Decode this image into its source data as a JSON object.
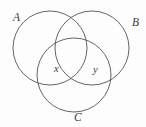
{
  "figure": {
    "type": "venn-diagram-three-sets",
    "background_color": "#fdfdfd",
    "stroke_color": "#555555"
  },
  "sets": [
    {
      "id": "A",
      "label": "A",
      "cx": 50,
      "cy": 48,
      "r": 37
    },
    {
      "id": "B",
      "label": "B",
      "cx": 92,
      "cy": 48,
      "r": 37
    },
    {
      "id": "C",
      "label": "C",
      "cx": 74,
      "cy": 75,
      "r": 37
    }
  ],
  "regions": [
    {
      "id": "x",
      "label": "x",
      "description": "A and C, not B"
    },
    {
      "id": "y",
      "label": "y",
      "description": "B and C, not A"
    }
  ],
  "labels": {
    "set_a": "A",
    "set_b": "B",
    "set_c": "C",
    "region_x": "x",
    "region_y": "y"
  }
}
